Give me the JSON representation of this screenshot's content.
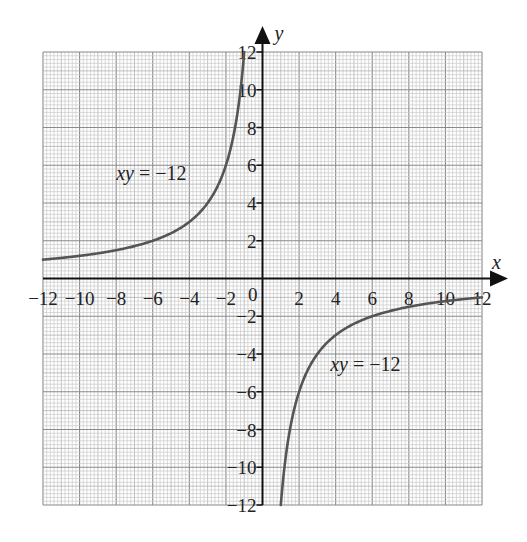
{
  "chart_data": {
    "type": "line",
    "title": "",
    "xlabel": "x",
    "ylabel": "y",
    "xlim": [
      -12,
      12
    ],
    "ylim": [
      -12,
      12
    ],
    "grid": {
      "on": true,
      "minor_step": 0.2,
      "major_step": 2
    },
    "x_ticks": [
      -12,
      -10,
      -8,
      -6,
      -4,
      -2,
      2,
      4,
      6,
      8,
      10,
      12
    ],
    "y_ticks": [
      -12,
      -10,
      -8,
      -6,
      -4,
      -2,
      2,
      4,
      6,
      8,
      10,
      12
    ],
    "origin_label": "0",
    "series": [
      {
        "name": "xy = -12 (branch x<0)",
        "equation": "y = -12/x",
        "x": [
          -12,
          -10,
          -8,
          -6,
          -4,
          -3,
          -2,
          -1.5,
          -1.2,
          -1
        ],
        "y": [
          1,
          1.2,
          1.5,
          2,
          3,
          4,
          6,
          8,
          10,
          12
        ]
      },
      {
        "name": "xy = -12 (branch x>0)",
        "equation": "y = -12/x",
        "x": [
          1,
          1.2,
          1.5,
          2,
          3,
          4,
          6,
          8,
          10,
          12
        ],
        "y": [
          -12,
          -10,
          -8,
          -6,
          -4,
          -3,
          -2,
          -1.5,
          -1.2,
          -1
        ]
      }
    ],
    "annotations": [
      {
        "text_italic": "xy",
        "text_rest": " = −12",
        "x": -8,
        "y": 5.2
      },
      {
        "text_italic": "xy",
        "text_rest": " = −12",
        "x": 3.7,
        "y": -4.9
      }
    ]
  },
  "labels": {
    "x_axis": "x",
    "y_axis": "y",
    "origin": "0",
    "annotation_italic": "xy",
    "annotation_rest": " = −12"
  },
  "colors": {
    "curve": "#555555",
    "axis": "#111111",
    "grid_minor": "#c8c8c8",
    "grid_major": "#8a8a8a"
  }
}
